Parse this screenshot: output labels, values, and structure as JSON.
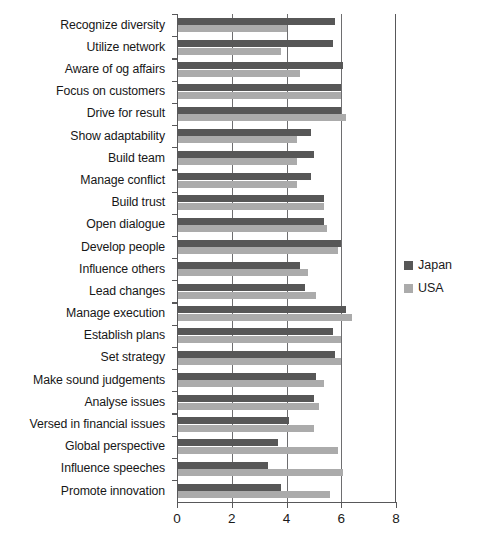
{
  "chart_data": {
    "type": "bar",
    "orientation": "horizontal",
    "title": "",
    "subtitle": "",
    "xlabel": "",
    "ylabel": "",
    "xlim": [
      0,
      8
    ],
    "xticks": [
      0,
      2,
      4,
      6,
      8
    ],
    "xtick_labels": [
      "0",
      "2",
      "4",
      "6",
      "8"
    ],
    "grid": true,
    "grid_axis": "x",
    "legend_position": "right",
    "categories": [
      "Recognize diversity",
      "Utilize network",
      "Aware of og affairs",
      "Focus on customers",
      "Drive for result",
      "Show adaptability",
      "Build team",
      "Manage conflict",
      "Build trust",
      "Open dialogue",
      "Develop people",
      "Influence others",
      "Lead changes",
      "Manage execution",
      "Establish plans",
      "Set strategy",
      "Make sound judgements",
      "Analyse issues",
      "Versed in financial issues",
      "Global perspective",
      "Influence speeches",
      "Promote innovation"
    ],
    "series": [
      {
        "name": "Japan",
        "color": "#575757",
        "values": [
          5.8,
          5.7,
          6.1,
          6.0,
          6.0,
          4.9,
          5.0,
          4.9,
          5.4,
          5.4,
          6.0,
          4.5,
          4.7,
          6.2,
          5.7,
          5.8,
          5.1,
          5.0,
          4.1,
          3.7,
          3.3,
          3.8
        ]
      },
      {
        "name": "USA",
        "color": "#ababab",
        "values": [
          4.0,
          3.8,
          4.5,
          6.0,
          6.2,
          4.4,
          4.4,
          4.4,
          5.4,
          5.5,
          5.9,
          4.8,
          5.1,
          6.4,
          6.0,
          6.0,
          5.4,
          5.2,
          5.0,
          5.9,
          6.1,
          5.6
        ]
      }
    ]
  },
  "legend": {
    "items": [
      {
        "label": "Japan",
        "color": "#575757"
      },
      {
        "label": "USA",
        "color": "#ababab"
      }
    ]
  }
}
